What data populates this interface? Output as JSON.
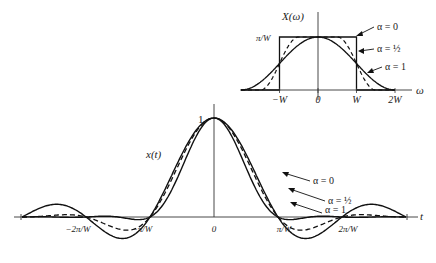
{
  "figure": {
    "main": {
      "ylabel": "x(t)",
      "xlabel": "t",
      "peak_label": "1",
      "ticks": [
        {
          "label": "−2π/W",
          "pos": -2
        },
        {
          "label": "−π/W",
          "pos": -1
        },
        {
          "label": "0",
          "pos": 0
        },
        {
          "label": "π/W",
          "pos": 1
        },
        {
          "label": "2π/W",
          "pos": 2
        }
      ],
      "legend": [
        {
          "label": "α = 0",
          "alpha": 0,
          "style": "solid"
        },
        {
          "label": "α = ½",
          "alpha": 0.5,
          "style": "dashed"
        },
        {
          "label": "α = 1",
          "alpha": 1,
          "style": "solid"
        }
      ]
    },
    "inset": {
      "ylabel": "X(ω)",
      "xlabel": "ω",
      "height_label": "π/W",
      "ticks": [
        {
          "label": "−W",
          "pos": -1
        },
        {
          "label": "0",
          "pos": 0
        },
        {
          "label": "W",
          "pos": 1
        },
        {
          "label": "2W",
          "pos": 2
        }
      ],
      "legend": [
        {
          "label": "α = 0",
          "alpha": 0
        },
        {
          "label": "α = ½",
          "alpha": 0.5
        },
        {
          "label": "α = 1",
          "alpha": 1
        }
      ]
    }
  },
  "chart_data": [
    {
      "type": "line",
      "title": "Raised-cosine pulse x(t)",
      "xlabel": "t",
      "ylabel": "x(t)",
      "x_ticks": [
        "−2π/W",
        "−π/W",
        "0",
        "π/W",
        "2π/W"
      ],
      "xlim_units_pi_over_W": [
        -3,
        3
      ],
      "ylim": [
        -0.25,
        1
      ],
      "series": [
        {
          "name": "α = 0",
          "formula": "sinc(Wt/π)",
          "style": "solid"
        },
        {
          "name": "α = ½",
          "formula": "sinc(Wt/π)·cos(αWt)/(1−(2αWt/π)²)",
          "style": "dashed"
        },
        {
          "name": "α = 1",
          "formula": "sinc(Wt/π)·cos(Wt)/(1−(2Wt/π)²)",
          "style": "solid"
        }
      ],
      "zero_crossings": [
        "±π/W",
        "±2π/W"
      ],
      "peak": {
        "t": 0,
        "value": 1
      }
    },
    {
      "type": "line",
      "title": "Raised-cosine spectrum X(ω)",
      "xlabel": "ω",
      "ylabel": "X(ω)",
      "x_ticks": [
        "−W",
        "0",
        "W",
        "2W"
      ],
      "y_tick": "π/W",
      "series": [
        {
          "name": "α = 0",
          "shape": "rectangle from −W to W, height π/W"
        },
        {
          "name": "α = ½",
          "shape": "flat to 0.5W, cosine rolloff to 1.5W"
        },
        {
          "name": "α = 1",
          "shape": "full cosine rolloff to 2W"
        }
      ]
    }
  ]
}
